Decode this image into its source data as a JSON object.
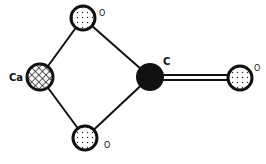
{
  "diagram": {
    "type": "molecular-structure",
    "atoms": [
      {
        "id": "ca",
        "label": "Ca",
        "style": "crosshatch",
        "cx": 40,
        "cy": 77,
        "r": 13,
        "lx": 9,
        "ly": 81
      },
      {
        "id": "o_top",
        "label": "O",
        "style": "dotted",
        "cx": 83,
        "cy": 18,
        "r": 12,
        "lx": 99,
        "ly": 16
      },
      {
        "id": "o_bottom",
        "label": "O",
        "style": "dotted",
        "cx": 85,
        "cy": 138,
        "r": 12,
        "lx": 104,
        "ly": 148
      },
      {
        "id": "c",
        "label": "C",
        "style": "solid-black",
        "cx": 150,
        "cy": 77,
        "r": 13,
        "lx": 163,
        "ly": 65
      },
      {
        "id": "o_right",
        "label": "O",
        "style": "dotted",
        "cx": 240,
        "cy": 78,
        "r": 12,
        "lx": 254,
        "ly": 71
      }
    ],
    "bonds": [
      {
        "from": "ca",
        "to": "o_top",
        "order": 1
      },
      {
        "from": "ca",
        "to": "o_bottom",
        "order": 1
      },
      {
        "from": "o_top",
        "to": "c",
        "order": 1
      },
      {
        "from": "o_bottom",
        "to": "c",
        "order": 1
      },
      {
        "from": "c",
        "to": "o_right",
        "order": 2
      }
    ],
    "colors": {
      "stroke": "#111111",
      "fill_solid": "#111111",
      "background": "#ffffff"
    }
  }
}
